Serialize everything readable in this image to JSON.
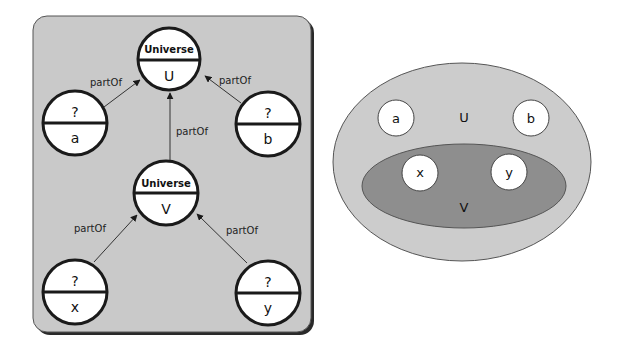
{
  "graph": {
    "nodes": {
      "U": {
        "type": "Universe",
        "name": "U"
      },
      "V": {
        "type": "Universe",
        "name": "V"
      },
      "a": {
        "type": "?",
        "name": "a"
      },
      "b": {
        "type": "?",
        "name": "b"
      },
      "x": {
        "type": "?",
        "name": "x"
      },
      "y": {
        "type": "?",
        "name": "y"
      }
    },
    "edges": [
      {
        "from": "a",
        "to": "U",
        "label": "partOf"
      },
      {
        "from": "b",
        "to": "U",
        "label": "partOf"
      },
      {
        "from": "V",
        "to": "U",
        "label": "partOf"
      },
      {
        "from": "x",
        "to": "V",
        "label": "partOf"
      },
      {
        "from": "y",
        "to": "V",
        "label": "partOf"
      }
    ]
  },
  "venn": {
    "outer_label": "U",
    "inner_label": "V",
    "outer_members": [
      "a",
      "b"
    ],
    "inner_members": [
      "x",
      "y"
    ]
  },
  "colors": {
    "panel_fill": "#c9c9c9",
    "panel_shadow": "#2a2a2a",
    "node_fill": "#ffffff",
    "node_stroke": "#1a1a1a",
    "outer_ellipse": "#cccccc",
    "inner_ellipse": "#8e8e8e"
  }
}
